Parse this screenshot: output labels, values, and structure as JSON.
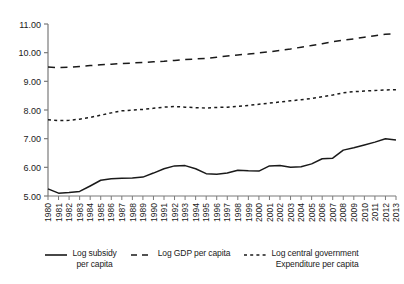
{
  "chart_data": {
    "type": "line",
    "title": "",
    "xlabel": "",
    "ylabel": "",
    "ylim": [
      5.0,
      11.0
    ],
    "ytick_step": 1.0,
    "ytick_labels": [
      "5.00",
      "6.00",
      "7.00",
      "8.00",
      "9.00",
      "10.00",
      "11.00"
    ],
    "ytick_values": [
      5.0,
      6.0,
      7.0,
      8.0,
      9.0,
      10.0,
      11.0
    ],
    "grid": false,
    "legend_position": "bottom",
    "x": [
      1980,
      1981,
      1982,
      1983,
      1984,
      1985,
      1986,
      1987,
      1988,
      1989,
      1990,
      1991,
      1992,
      1993,
      1994,
      1995,
      1996,
      1997,
      1998,
      1999,
      2000,
      2001,
      2002,
      2003,
      2004,
      2005,
      2006,
      2007,
      2008,
      2009,
      2010,
      2011,
      2012,
      2013
    ],
    "xtick_labels": [
      "1980",
      "1981",
      "1982",
      "1983",
      "1984",
      "1985",
      "1986",
      "1987",
      "1988",
      "1989",
      "1990",
      "1991",
      "1992",
      "1993",
      "1994",
      "1995",
      "1996",
      "1997",
      "1998",
      "1999",
      "2000",
      "2001",
      "2002",
      "2003",
      "2004",
      "2005",
      "2006",
      "2007",
      "2008",
      "2009",
      "2010",
      "2011",
      "2012",
      "2013"
    ],
    "series": [
      {
        "name": "Log subsidy per capita",
        "style": "solid",
        "color": "#1a1a1a",
        "values": [
          5.25,
          5.1,
          5.12,
          5.16,
          5.35,
          5.55,
          5.6,
          5.62,
          5.63,
          5.66,
          5.8,
          5.95,
          6.05,
          6.06,
          5.95,
          5.78,
          5.76,
          5.8,
          5.9,
          5.88,
          5.87,
          6.05,
          6.06,
          6.0,
          6.02,
          6.12,
          6.3,
          6.32,
          6.6,
          6.68,
          6.78,
          6.88,
          7.0,
          6.95
        ]
      },
      {
        "name": "Log GDP per capita",
        "style": "long-dash",
        "color": "#1a1a1a",
        "values": [
          9.5,
          9.48,
          9.49,
          9.52,
          9.55,
          9.58,
          9.6,
          9.62,
          9.64,
          9.66,
          9.68,
          9.7,
          9.73,
          9.76,
          9.78,
          9.8,
          9.84,
          9.88,
          9.92,
          9.95,
          9.99,
          10.03,
          10.08,
          10.13,
          10.19,
          10.25,
          10.31,
          10.38,
          10.44,
          10.48,
          10.54,
          10.59,
          10.64,
          10.66
        ]
      },
      {
        "name": "Log central government Expenditure per capita",
        "style": "short-dash",
        "color": "#1a1a1a",
        "values": [
          7.66,
          7.63,
          7.64,
          7.68,
          7.74,
          7.82,
          7.9,
          7.97,
          8.0,
          8.02,
          8.06,
          8.1,
          8.12,
          8.1,
          8.08,
          8.07,
          8.09,
          8.1,
          8.13,
          8.16,
          8.2,
          8.24,
          8.28,
          8.32,
          8.36,
          8.4,
          8.46,
          8.52,
          8.6,
          8.64,
          8.66,
          8.68,
          8.7,
          8.71
        ]
      }
    ]
  },
  "legend": {
    "items": [
      {
        "label": "Log subsidy\nper capita",
        "style": "solid",
        "swatch_name": "legend-swatch-solid"
      },
      {
        "label": "Log GDP per capita",
        "style": "long-dash",
        "swatch_name": "legend-swatch-long-dash"
      },
      {
        "label": "Log central government\nExpenditure per capita",
        "style": "short-dash",
        "swatch_name": "legend-swatch-short-dash"
      }
    ]
  }
}
